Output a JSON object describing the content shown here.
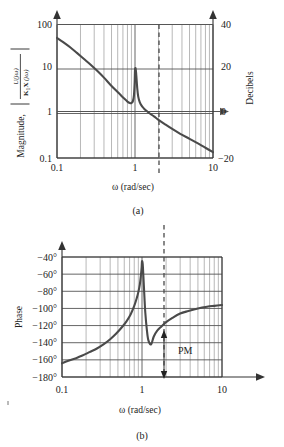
{
  "figure": {
    "caption_a": "(a)",
    "caption_b": "(b)"
  },
  "panel_a": {
    "ylabel_prefix": "Magnitude,",
    "ylabel_numerator": "U(jω)",
    "ylabel_denominator_k": "K",
    "ylabel_denominator_k_sub": "1",
    "ylabel_denominator_x": "X",
    "ylabel_denominator_arg": "(jω)",
    "ylabel_right": "Decibels",
    "xlabel": "ω (rad/sec)",
    "yticks_left": [
      "100",
      "10",
      "1",
      "0.1"
    ],
    "yticks_right": [
      "40",
      "20",
      "0",
      "−20"
    ],
    "xticks": [
      "0.1",
      "1",
      "10"
    ]
  },
  "panel_b": {
    "ylabel": "Phase",
    "xlabel": "ω (rad/sec)",
    "yticks": [
      "−40°",
      "−60°",
      "−80°",
      "−100°",
      "−120°",
      "−140°",
      "−160°",
      "−180°"
    ],
    "xticks": [
      "0.1",
      "1",
      "10"
    ],
    "annotation_pm": "PM"
  },
  "chart_data": [
    {
      "type": "line",
      "title": "",
      "xlabel": "ω (rad/sec)",
      "ylabel": "Magnitude, |U(jω)/K₁X(jω)|",
      "ylabel_secondary": "Decibels",
      "xscale": "log",
      "yscale": "log",
      "xlim": [
        0.1,
        10
      ],
      "ylim": [
        0.1,
        100
      ],
      "ylim_db": [
        -20,
        40
      ],
      "grid": true,
      "legend": "none",
      "xticks": [
        0.1,
        1,
        10
      ],
      "yticks": [
        0.1,
        1,
        10,
        100
      ],
      "yticks_db": [
        -20,
        0,
        20,
        40
      ],
      "annotations": [
        {
          "text": "gain crossover dashed line",
          "x": 1.4,
          "y": 1.0,
          "style": "dashed-vertical"
        }
      ],
      "series": [
        {
          "name": "magnitude",
          "x": [
            0.1,
            0.12,
            0.15,
            0.18,
            0.22,
            0.27,
            0.33,
            0.4,
            0.48,
            0.56,
            0.64,
            0.72,
            0.8,
            0.86,
            0.9,
            0.94,
            0.97,
            0.99,
            1.0,
            1.02,
            1.04,
            1.07,
            1.1,
            1.15,
            1.22,
            1.3,
            1.4,
            1.55,
            1.75,
            2.0,
            2.4,
            3.0,
            3.8,
            5.0,
            6.5,
            8.0,
            10.0
          ],
          "y": [
            50.0,
            40.0,
            30.0,
            23.0,
            17.0,
            12.5,
            9.0,
            6.4,
            4.5,
            3.4,
            2.7,
            2.2,
            1.85,
            1.72,
            1.72,
            1.9,
            2.6,
            5.0,
            9.5,
            10.2,
            7.0,
            3.6,
            2.4,
            1.8,
            1.48,
            1.3,
            1.15,
            1.0,
            0.86,
            0.72,
            0.58,
            0.45,
            0.35,
            0.27,
            0.21,
            0.17,
            0.135
          ]
        }
      ]
    },
    {
      "type": "line",
      "title": "",
      "xlabel": "ω (rad/sec)",
      "ylabel": "Phase",
      "xscale": "log",
      "yscale": "linear",
      "xlim": [
        0.1,
        10
      ],
      "ylim": [
        -180,
        -40
      ],
      "grid": true,
      "legend": "none",
      "xticks": [
        0.1,
        1,
        10
      ],
      "yticks": [
        -40,
        -60,
        -80,
        -100,
        -120,
        -140,
        -160,
        -180
      ],
      "annotations": [
        {
          "text": "PM",
          "x": 1.55,
          "y": -150,
          "style": "label"
        },
        {
          "text": "phase margin arrow",
          "x": 1.4,
          "y_from": -180,
          "y_to": -130,
          "style": "double-arrow"
        },
        {
          "text": "gain crossover dashed line",
          "x": 1.4,
          "y_from": -40,
          "y_to": -180,
          "style": "dashed-vertical"
        }
      ],
      "series": [
        {
          "name": "phase",
          "x": [
            0.1,
            0.12,
            0.15,
            0.18,
            0.22,
            0.27,
            0.33,
            0.4,
            0.48,
            0.56,
            0.64,
            0.72,
            0.8,
            0.86,
            0.9,
            0.94,
            0.97,
            0.99,
            1.0,
            1.02,
            1.04,
            1.07,
            1.1,
            1.15,
            1.2,
            1.3,
            1.4,
            1.55,
            1.75,
            2.0,
            2.4,
            3.0,
            3.8,
            5.0,
            6.5,
            8.0,
            10.0
          ],
          "y": [
            -164,
            -161,
            -158,
            -155,
            -151,
            -147,
            -142,
            -136,
            -129,
            -122,
            -115,
            -107,
            -97,
            -88,
            -81,
            -72,
            -61,
            -52,
            -45,
            -48,
            -62,
            -85,
            -105,
            -125,
            -137,
            -142,
            -133,
            -126,
            -121,
            -116,
            -111,
            -106,
            -103,
            -100,
            -98,
            -97,
            -96
          ]
        }
      ]
    }
  ]
}
